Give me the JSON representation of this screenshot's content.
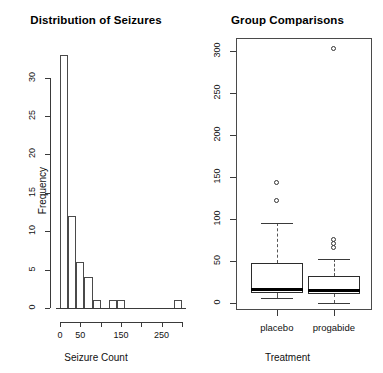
{
  "chart_data": [
    {
      "type": "bar",
      "title": "Distribution of Seizures",
      "xlabel": "Seizure Count",
      "ylabel": "Frequency",
      "xlim": [
        -10,
        310
      ],
      "ylim": [
        0,
        34
      ],
      "xticks": [
        0,
        50,
        100,
        150,
        200,
        250,
        300
      ],
      "xticklabels": [
        "0",
        "50",
        "",
        "150",
        "",
        "250",
        ""
      ],
      "yticks": [
        0,
        5,
        10,
        15,
        20,
        25,
        30
      ],
      "yticklabels": [
        "0",
        "5",
        "10",
        "15",
        "20",
        "25",
        "30"
      ],
      "binwidth": 20,
      "bins": [
        {
          "start": 0,
          "end": 20,
          "count": 33
        },
        {
          "start": 20,
          "end": 40,
          "count": 12
        },
        {
          "start": 40,
          "end": 60,
          "count": 6
        },
        {
          "start": 60,
          "end": 80,
          "count": 4
        },
        {
          "start": 80,
          "end": 100,
          "count": 1
        },
        {
          "start": 100,
          "end": 120,
          "count": 0
        },
        {
          "start": 120,
          "end": 140,
          "count": 1
        },
        {
          "start": 140,
          "end": 160,
          "count": 1
        },
        {
          "start": 160,
          "end": 180,
          "count": 0
        },
        {
          "start": 180,
          "end": 200,
          "count": 0
        },
        {
          "start": 200,
          "end": 220,
          "count": 0
        },
        {
          "start": 220,
          "end": 240,
          "count": 0
        },
        {
          "start": 240,
          "end": 260,
          "count": 0
        },
        {
          "start": 260,
          "end": 280,
          "count": 0
        },
        {
          "start": 280,
          "end": 300,
          "count": 1
        }
      ],
      "grid": false,
      "legend": "none"
    },
    {
      "type": "box",
      "title": "Group Comparisons",
      "xlabel": "Treatment",
      "ylabel": "",
      "ylim": [
        -8,
        315
      ],
      "yticks": [
        0,
        50,
        100,
        150,
        200,
        250,
        300
      ],
      "yticklabels": [
        "0",
        "50",
        "100",
        "150",
        "200",
        "250",
        "300"
      ],
      "categories": [
        "placebo",
        "progabide"
      ],
      "boxes": [
        {
          "name": "placebo",
          "whisker_low": 6,
          "q1": 12,
          "median": 16,
          "q3": 48,
          "whisker_high": 95,
          "outliers": [
            122,
            143
          ]
        },
        {
          "name": "progabide",
          "whisker_low": 0,
          "q1": 11,
          "median": 15,
          "q3": 32,
          "whisker_high": 52,
          "outliers": [
            66,
            71,
            76,
            302
          ]
        }
      ],
      "grid": false,
      "legend": "none"
    }
  ],
  "histogram": {
    "title": "Distribution of Seizures",
    "xlabel": "Seizure Count",
    "ylabel": "Frequency"
  },
  "boxplot": {
    "title": "Group Comparisons",
    "xlabel": "Treatment",
    "group_placebo": "placebo",
    "group_progabide": "progabide"
  },
  "colors": {
    "line": "#3a3a3a",
    "median": "#000000",
    "background": "#ffffff"
  }
}
